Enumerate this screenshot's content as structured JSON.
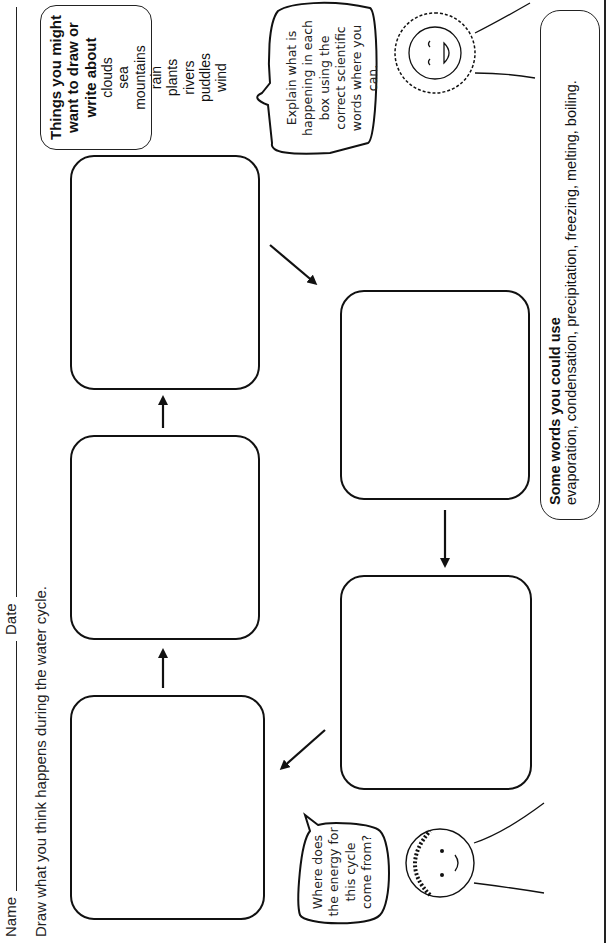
{
  "header": {
    "name_label": "Name",
    "date_label": "Date",
    "instruction": "Draw what you think happens during the water cycle."
  },
  "boxes": [
    {
      "id": "box-1",
      "label": ""
    },
    {
      "id": "box-2",
      "label": ""
    },
    {
      "id": "box-3",
      "label": ""
    },
    {
      "id": "box-4",
      "label": ""
    },
    {
      "id": "box-5",
      "label": ""
    }
  ],
  "things_box": {
    "title": "Things you might want to draw or write about",
    "items": [
      "clouds",
      "sea",
      "mountains",
      "rain",
      "plants",
      "rivers",
      "puddles",
      "wind"
    ]
  },
  "speech_bubbles": {
    "top_right": "Explain what is happening in each box using the correct scientific words where you can.",
    "bottom_left": "Where does the energy for this cycle come from?"
  },
  "words_box": {
    "title": "Some words you could use",
    "list": "evaporation, condensation, precipitation, freezing, melting, boiling."
  },
  "footer": {
    "text": "Assessing Science"
  }
}
